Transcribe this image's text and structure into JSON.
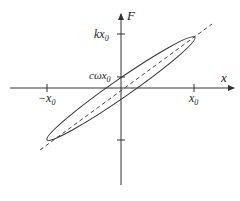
{
  "diagram": {
    "type": "hysteresis-ellipse",
    "axes": {
      "x_label": "x",
      "y_label": "F"
    },
    "ticks": {
      "x_pos": {
        "main": "x",
        "sub": "0"
      },
      "x_neg": {
        "main": "−x",
        "sub": "0"
      },
      "y_top": {
        "main": "kx",
        "sub": "0"
      },
      "y_intercept": {
        "main": "cωx",
        "sub": "0"
      }
    },
    "elements": {
      "ellipse": "elliptical loop",
      "dashed_line": "stiffness line through origin"
    },
    "colors": {
      "stroke": "#333333",
      "background": "#ffffff"
    }
  }
}
